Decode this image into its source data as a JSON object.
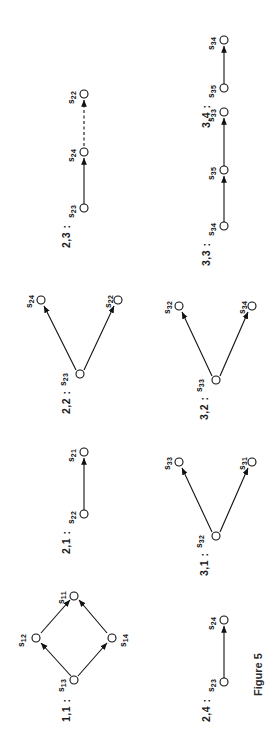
{
  "figure": {
    "caption": "Figure 5",
    "rotation_degrees": -90
  },
  "panels": [
    {
      "id": "1-1",
      "label": "1,1 :",
      "layout": "diamond",
      "nodes": [
        {
          "name": "s13",
          "base": "s",
          "sub": "13"
        },
        {
          "name": "s12",
          "base": "s",
          "sub": "12"
        },
        {
          "name": "s11",
          "base": "s",
          "sub": "11"
        },
        {
          "name": "s14",
          "base": "s",
          "sub": "14"
        }
      ],
      "edges": [
        {
          "from": "s13",
          "to": "s12",
          "style": "solid"
        },
        {
          "from": "s13",
          "to": "s14",
          "style": "solid"
        },
        {
          "from": "s12",
          "to": "s11",
          "style": "solid"
        },
        {
          "from": "s14",
          "to": "s11",
          "style": "solid"
        }
      ]
    },
    {
      "id": "2-1",
      "label": "2,1 :",
      "layout": "chain2",
      "nodes": [
        {
          "name": "s22",
          "base": "s",
          "sub": "22"
        },
        {
          "name": "s21",
          "base": "s",
          "sub": "21"
        }
      ],
      "edges": [
        {
          "from": "s22",
          "to": "s21",
          "style": "solid"
        }
      ]
    },
    {
      "id": "2-2",
      "label": "2,2 :",
      "layout": "fork",
      "nodes": [
        {
          "name": "s23",
          "base": "s",
          "sub": "23"
        },
        {
          "name": "s24",
          "base": "s",
          "sub": "24"
        },
        {
          "name": "s22",
          "base": "s",
          "sub": "22"
        }
      ],
      "edges": [
        {
          "from": "s23",
          "to": "s24",
          "style": "solid"
        },
        {
          "from": "s23",
          "to": "s22",
          "style": "solid"
        }
      ]
    },
    {
      "id": "2-3",
      "label": "2,3 :",
      "layout": "chain3",
      "nodes": [
        {
          "name": "s23",
          "base": "s",
          "sub": "23"
        },
        {
          "name": "s24",
          "base": "s",
          "sub": "24"
        },
        {
          "name": "s22",
          "base": "s",
          "sub": "22"
        }
      ],
      "edges": [
        {
          "from": "s23",
          "to": "s24",
          "style": "solid"
        },
        {
          "from": "s24",
          "to": "s22",
          "style": "dashed"
        }
      ]
    },
    {
      "id": "2-4",
      "label": "2,4 :",
      "layout": "chain2",
      "nodes": [
        {
          "name": "s23",
          "base": "s",
          "sub": "23"
        },
        {
          "name": "s24",
          "base": "s",
          "sub": "24"
        }
      ],
      "edges": [
        {
          "from": "s23",
          "to": "s24",
          "style": "solid"
        }
      ]
    },
    {
      "id": "3-1",
      "label": "3,1 :",
      "layout": "fork",
      "nodes": [
        {
          "name": "s32",
          "base": "s",
          "sub": "32"
        },
        {
          "name": "s33",
          "base": "s",
          "sub": "33"
        },
        {
          "name": "s31",
          "base": "s",
          "sub": "31"
        }
      ],
      "edges": [
        {
          "from": "s32",
          "to": "s33",
          "style": "solid"
        },
        {
          "from": "s32",
          "to": "s31",
          "style": "solid"
        }
      ]
    },
    {
      "id": "3-2",
      "label": "3,2 :",
      "layout": "fork",
      "nodes": [
        {
          "name": "s33",
          "base": "s",
          "sub": "33"
        },
        {
          "name": "s32",
          "base": "s",
          "sub": "32"
        },
        {
          "name": "s34",
          "base": "s",
          "sub": "34"
        }
      ],
      "edges": [
        {
          "from": "s33",
          "to": "s32",
          "style": "solid"
        },
        {
          "from": "s33",
          "to": "s34",
          "style": "solid"
        }
      ]
    },
    {
      "id": "3-3",
      "label": "3,3 :",
      "layout": "chain3",
      "nodes": [
        {
          "name": "s34",
          "base": "s",
          "sub": "34"
        },
        {
          "name": "s35",
          "base": "s",
          "sub": "35"
        },
        {
          "name": "s33",
          "base": "s",
          "sub": "33"
        }
      ],
      "edges": [
        {
          "from": "s34",
          "to": "s35",
          "style": "solid"
        },
        {
          "from": "s35",
          "to": "s33",
          "style": "solid"
        }
      ]
    },
    {
      "id": "3-4",
      "label": "3,4 :",
      "layout": "chain2",
      "nodes": [
        {
          "name": "s35",
          "base": "s",
          "sub": "35"
        },
        {
          "name": "s34",
          "base": "s",
          "sub": "34"
        }
      ],
      "edges": [
        {
          "from": "s35",
          "to": "s34",
          "style": "solid"
        }
      ]
    }
  ],
  "colors": {
    "ink": "#111111",
    "paper": "#ffffff"
  }
}
